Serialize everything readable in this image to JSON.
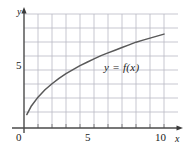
{
  "chart_data": {
    "type": "line",
    "title": "",
    "subtitle": "",
    "xlabel": "x",
    "ylabel": "y",
    "xlim": [
      0,
      11
    ],
    "ylim": [
      0,
      8.5
    ],
    "grid": true,
    "legend_position": "inline-annotation",
    "annotations": [
      {
        "text": "y = f(x)",
        "x": 6.2,
        "y": 5.9,
        "style": "italic"
      }
    ],
    "x_ticks": [
      {
        "value": 0,
        "label": "0"
      },
      {
        "value": 5,
        "label": "5"
      },
      {
        "value": 10,
        "label": "10"
      }
    ],
    "y_ticks": [
      {
        "value": 5,
        "label": "5"
      }
    ],
    "x_gridlines": [
      1,
      2,
      3,
      4,
      5,
      6,
      7,
      8,
      9,
      10
    ],
    "y_gridlines": [
      1,
      2,
      3,
      4,
      5,
      6,
      7,
      8
    ],
    "axis_arrows": {
      "x": true,
      "y": true
    },
    "series": [
      {
        "name": "y = f(x)",
        "color": "#595959",
        "shape": "concave-increasing",
        "x": [
          0.2,
          0.5,
          1.0,
          1.5,
          2.0,
          2.5,
          3.0,
          3.5,
          4.0,
          4.5,
          5.0,
          5.5,
          6.0,
          6.5,
          7.0,
          7.5,
          8.0,
          8.5,
          9.0,
          9.5,
          10.0
        ],
        "y": [
          1.0,
          1.6,
          2.3,
          2.85,
          3.3,
          3.7,
          4.05,
          4.35,
          4.65,
          4.9,
          5.15,
          5.4,
          5.6,
          5.8,
          6.0,
          6.2,
          6.4,
          6.55,
          6.7,
          6.85,
          7.0
        ]
      }
    ]
  },
  "labels": {
    "y_axis_name": "y",
    "x_axis_name": "x",
    "x_tick_0": "0",
    "x_tick_5": "5",
    "x_tick_10": "10",
    "y_tick_5": "5",
    "curve_label": "y = f(x)"
  },
  "colors": {
    "grid": "#b9b9c4",
    "axis": "#4a4a4a",
    "curve": "#5a5a5a",
    "text": "#1a1a1a",
    "background": "#ffffff"
  }
}
